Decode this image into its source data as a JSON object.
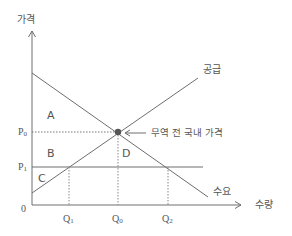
{
  "diagram": {
    "axes": {
      "y_label": "가격",
      "x_label": "수량",
      "origin_label": "0"
    },
    "curves": {
      "supply_label": "공급",
      "demand_label": "수요"
    },
    "price_labels": {
      "p0": "P0",
      "p1": "P1"
    },
    "quantity_labels": {
      "q1": "Q1",
      "q0": "Q0",
      "q2": "Q2"
    },
    "areas": {
      "a": "A",
      "b": "B",
      "c": "C",
      "d": "D"
    },
    "annotation": {
      "equilibrium": "무역 전 국내 가격"
    },
    "colors": {
      "line": "#6e6e6e",
      "text": "#555555",
      "point": "#555555"
    }
  }
}
